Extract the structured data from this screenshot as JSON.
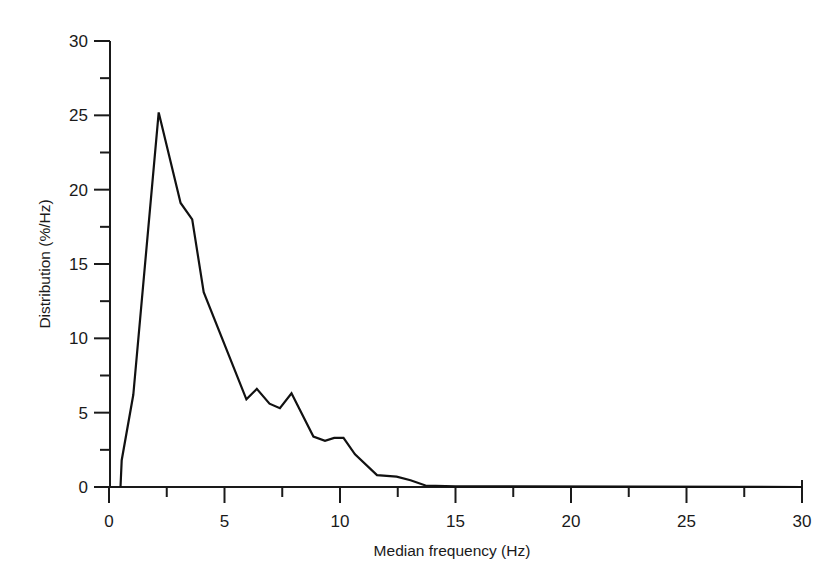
{
  "chart_data": {
    "type": "line",
    "title": "",
    "xlabel": "Median frequency (Hz)",
    "ylabel": "Distribution (%/Hz)",
    "xlim": [
      0,
      30
    ],
    "ylim": [
      0,
      30
    ],
    "x_ticks": [
      0,
      5,
      10,
      15,
      20,
      25,
      30
    ],
    "x_minor_ticks": [
      2.5,
      7.5,
      12.5,
      17.5,
      22.5,
      27.5
    ],
    "y_ticks": [
      0,
      5,
      10,
      15,
      20,
      25,
      30
    ],
    "y_minor_ticks": [
      2.5,
      7.5,
      12.5,
      17.5,
      22.5,
      27.5
    ],
    "grid": false,
    "legend": null,
    "series": [
      {
        "name": "Distribution",
        "x": [
          0.5,
          0.55,
          1.05,
          2.15,
          3.1,
          3.6,
          4.1,
          5.95,
          6.4,
          6.95,
          7.4,
          7.9,
          8.85,
          9.35,
          9.75,
          10.15,
          10.65,
          11.6,
          12.45,
          13.05,
          13.7,
          15.0,
          30.0
        ],
        "y": [
          0.0,
          1.8,
          6.2,
          25.2,
          19.1,
          18.0,
          13.1,
          5.9,
          6.6,
          5.6,
          5.3,
          6.3,
          3.4,
          3.1,
          3.3,
          3.3,
          2.2,
          0.8,
          0.7,
          0.45,
          0.1,
          0.05,
          0.0
        ]
      }
    ],
    "color": "#111111"
  }
}
